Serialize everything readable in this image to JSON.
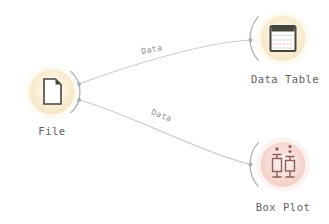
{
  "app": "workflow-canvas",
  "colors": {
    "background": "#ffffff",
    "cream_center": "#fffef8",
    "cream_mid": "#faf0d8",
    "cream_edge": "#f3e3c1",
    "pink_center": "#fdf3f1",
    "pink_mid": "#f8dcd6",
    "pink_edge": "#f1ccc4",
    "link_line": "#c9cdd1",
    "anchor": "#a9b1b7",
    "node_label": "#606060",
    "link_label": "#8b8b8b",
    "icon_dark": "#45443f",
    "paper_white": "#ffffff",
    "table_line": "#cfcfcf",
    "table_accent": "#e6aca4",
    "boxplot_glyph": "#8d5f5a"
  },
  "nodes": [
    {
      "id": "file",
      "label": "File",
      "icon": "file-document-icon",
      "category": "Data"
    },
    {
      "id": "data-table",
      "label": "Data Table",
      "icon": "data-table-icon",
      "category": "Data"
    },
    {
      "id": "box-plot",
      "label": "Box Plot",
      "icon": "box-plot-icon",
      "category": "Visualize"
    }
  ],
  "links": [
    {
      "from": "File",
      "to": "Data Table",
      "label": "Data"
    },
    {
      "from": "File",
      "to": "Box Plot",
      "label": "Data"
    }
  ]
}
